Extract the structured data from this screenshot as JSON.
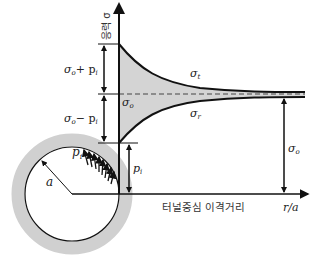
{
  "diagram": {
    "title": "",
    "y_axis_label": "응력 σ",
    "x_axis_label": "r/a",
    "x_axis_caption": "터널중심 이격거리",
    "curves": {
      "tangential": "σ",
      "tangential_sub": "t",
      "radial": "σ",
      "radial_sub": "r"
    },
    "far_field_label": "σ",
    "far_field_sub": "o",
    "far_field_right": "σ",
    "far_field_right_sub": "o",
    "dim_upper": "σ",
    "dim_upper_sub": "o",
    "dim_upper_rest": "+ p",
    "dim_upper_rest_sub": "i",
    "dim_lower": "σ",
    "dim_lower_sub": "o",
    "dim_lower_rest": "− p",
    "dim_lower_rest_sub": "i",
    "internal_pressure": "p",
    "internal_pressure_sub": "i",
    "radius_label": "a",
    "pressure_label": "p",
    "pressure_label_sub": "i"
  },
  "colors": {
    "fill_gray": "#d4d4d4",
    "line": "#111111",
    "ring": "#d0d0d0"
  }
}
